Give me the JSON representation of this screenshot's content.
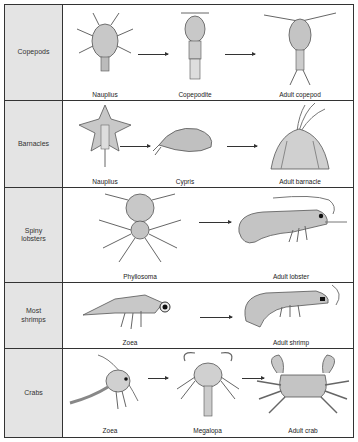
{
  "figure": {
    "rows": [
      {
        "group": "Copepods",
        "stages": [
          "Nauplius",
          "Copepodite",
          "Adult copepod"
        ]
      },
      {
        "group": "Barnacles",
        "stages": [
          "Nauplius",
          "Cypris",
          "Adult barnacle"
        ]
      },
      {
        "group": "Spiny\nlobsters",
        "stages": [
          "Phyllosoma",
          "Adult lobster"
        ]
      },
      {
        "group": "Most\nshrimps",
        "stages": [
          "Zoea",
          "Adult shrimp"
        ]
      },
      {
        "group": "Crabs",
        "stages": [
          "Zoea",
          "Megalopa",
          "Adult crab"
        ]
      }
    ],
    "colors": {
      "label_bg": "#e4e4e4",
      "border": "#333333",
      "illustration": "#9a9a9a"
    }
  }
}
